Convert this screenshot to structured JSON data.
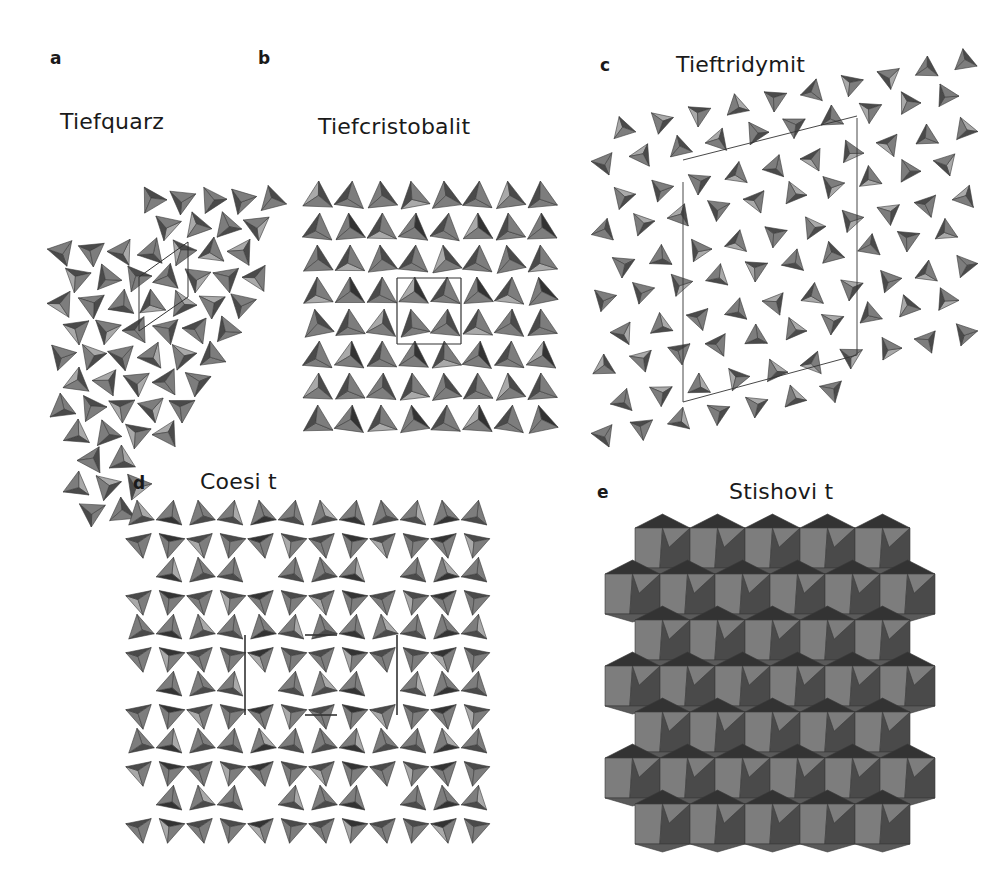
{
  "figure": {
    "colors": {
      "background": "#ffffff",
      "face_light": "#a9a9a9",
      "face_mid": "#7d7d7d",
      "face_dark": "#4a4a4a",
      "face_darker": "#333333",
      "cell_line": "#333333",
      "text": "#1a1a1a"
    },
    "panels": [
      {
        "id": "a",
        "letter": "a",
        "title": "Tiefquarz",
        "structure": "tetrahedral framework (trigonal)",
        "unit_cell_shape": "rhombus",
        "letter_pos": [
          50,
          50
        ],
        "title_pos": [
          60,
          111
        ],
        "region": [
          45,
          95,
          240,
          370
        ]
      },
      {
        "id": "b",
        "letter": "b",
        "title": "Tiefcristobalit",
        "structure": "tetrahedral framework (tetragonal)",
        "unit_cell_shape": "square",
        "letter_pos": [
          258,
          50
        ],
        "title_pos": [
          318,
          116
        ],
        "region": [
          300,
          180,
          265,
          265
        ]
      },
      {
        "id": "c",
        "letter": "c",
        "title": "Tieftridymit",
        "structure": "tetrahedral framework (sheared hexagonal rings)",
        "unit_cell_shape": "parallelogram",
        "letter_pos": [
          600,
          57
        ],
        "title_pos": [
          676,
          54
        ],
        "region": [
          590,
          55,
          385,
          410
        ]
      },
      {
        "id": "d",
        "letter": "d",
        "title": "Coesit",
        "title_display": "Coesi t",
        "structure": "tetrahedral framework (monoclinic)",
        "unit_cell_shape": "rectangle",
        "letter_pos": [
          133,
          475
        ],
        "title_pos": [
          200,
          471
        ],
        "region": [
          125,
          500,
          370,
          360
        ]
      },
      {
        "id": "e",
        "letter": "e",
        "title": "Stishovit",
        "title_display": "Stishovi t",
        "structure": "octahedral framework (rutile-type)",
        "unit_cell_shape": "none",
        "letter_pos": [
          597,
          484
        ],
        "title_pos": [
          729,
          481
        ],
        "region": [
          600,
          515,
          365,
          345
        ]
      }
    ]
  }
}
